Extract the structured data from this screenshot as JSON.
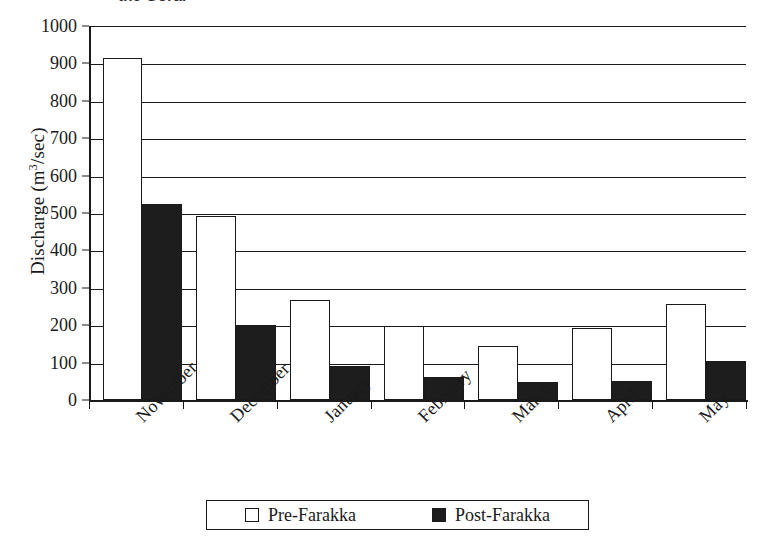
{
  "chart_data": {
    "type": "bar",
    "title": "the Gorai",
    "title_clipped": true,
    "xlabel": "",
    "ylabel": "Discharge (m³/sec)",
    "ylabel_parts": {
      "prefix": "Discharge (m",
      "sup": "3",
      "suffix": "/sec)"
    },
    "categories": [
      "November",
      "December",
      "January",
      "February",
      "March",
      "April",
      "May"
    ],
    "series": [
      {
        "name": "Pre-Farakka",
        "color": "#ffffff",
        "values": [
          915,
          492,
          267,
          197,
          145,
          193,
          257
        ]
      },
      {
        "name": "Post-Farakka",
        "color": "#1d1d1d",
        "values": [
          525,
          200,
          90,
          62,
          47,
          52,
          103
        ]
      }
    ],
    "ylim": [
      0,
      1000
    ],
    "yticks": [
      0,
      100,
      200,
      300,
      400,
      500,
      600,
      700,
      800,
      900,
      1000
    ],
    "ytick_labels": [
      "0",
      "100",
      "200",
      "300",
      "400",
      "500",
      "600",
      "700",
      "800",
      "900",
      "1000"
    ],
    "grid": true,
    "grid_axis": "y",
    "legend_position": "bottom-center",
    "legend_entries": [
      "Pre-Farakka",
      "Post-Farakka"
    ],
    "xtick_label_rotation": -45
  },
  "legend": {
    "pre_label": "Pre-Farakka",
    "post_label": "Post-Farakka"
  }
}
